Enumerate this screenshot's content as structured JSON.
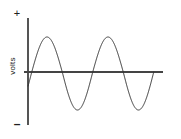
{
  "figure": {
    "background_color": "#ffffff",
    "width": 181,
    "height": 139
  },
  "labels": {
    "positive_polarity": "+",
    "negative_polarity": "–",
    "y_axis_title": "volts"
  },
  "chart_data": {
    "type": "line",
    "title": "",
    "xlabel": "",
    "ylabel": "volts",
    "grid": false,
    "legend_position": "none",
    "series": [
      {
        "name": "sine-waveform",
        "description": "two full sine wave cycles of alternating voltage",
        "cycles": 2,
        "amplitude": 1,
        "phase_start_deg": -20,
        "line_color": "#333333",
        "line_width": 1,
        "x": [
          -0.06,
          0.0,
          0.125,
          0.25,
          0.375,
          0.5,
          0.625,
          0.75,
          0.875,
          1.0,
          1.125,
          1.25,
          1.375,
          1.5,
          1.625,
          1.75,
          1.875,
          2.0
        ],
        "y": [
          -0.37,
          0.0,
          0.71,
          1.0,
          0.71,
          0.0,
          -0.71,
          -1.0,
          -0.71,
          0.0,
          0.71,
          1.0,
          0.71,
          0.0,
          -0.71,
          -1.0,
          -0.71,
          0.0
        ]
      }
    ],
    "peaks": [
      {
        "x_px": 47,
        "y_px": 37,
        "value": 1
      },
      {
        "x_px": 108,
        "y_px": 37,
        "value": 1
      }
    ],
    "troughs": [
      {
        "x_px": 78,
        "y_px": 110,
        "value": -1
      },
      {
        "x_px": 140,
        "y_px": 110,
        "value": -1
      }
    ],
    "axes": {
      "vertical_axis": {
        "x_px": 28,
        "y_top_px": 18,
        "y_bottom_px": 125,
        "color": "#555555"
      },
      "horizontal_axis": {
        "y_px": 72,
        "x_left_px": 24,
        "x_right_px": 163,
        "color": "#444444"
      }
    },
    "ylim": [
      -1.15,
      1.15
    ],
    "xlim": [
      -0.06,
      2.0
    ]
  }
}
